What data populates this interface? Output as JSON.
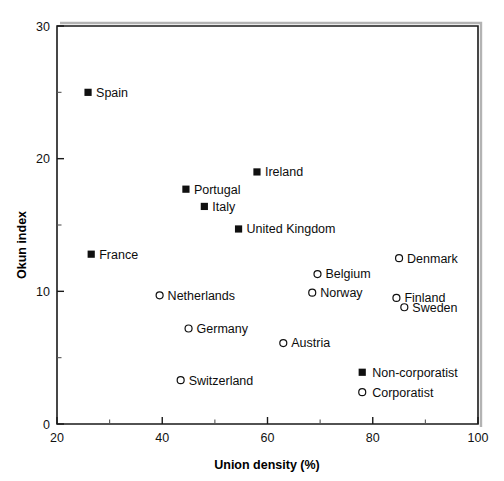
{
  "chart_data": {
    "type": "scatter",
    "title": "",
    "xlabel": "Union density (%)",
    "ylabel": "Okun index",
    "xlim": [
      20,
      100
    ],
    "ylim": [
      0,
      30
    ],
    "grid": false,
    "xticks": [
      20,
      40,
      60,
      80,
      100
    ],
    "xtick_labels": [
      "20",
      "40",
      "60",
      "80",
      "100"
    ],
    "xticks_minor": [
      30,
      50,
      70,
      90
    ],
    "yticks": [
      0,
      10,
      20,
      30
    ],
    "ytick_labels": [
      "0",
      "10",
      "20",
      "30"
    ],
    "yticks_minor": [
      5,
      15,
      25
    ],
    "legend_position": "inside-bottom-right",
    "series": [
      {
        "name": "Non-corporatist",
        "marker": "filled-square",
        "points": [
          {
            "label": "Spain",
            "x": 25.9,
            "y": 25.0,
            "label_side": "right"
          },
          {
            "label": "Ireland",
            "x": 58.0,
            "y": 19.0,
            "label_side": "right"
          },
          {
            "label": "Portugal",
            "x": 44.5,
            "y": 17.7,
            "label_side": "right"
          },
          {
            "label": "Italy",
            "x": 48.0,
            "y": 16.4,
            "label_side": "right"
          },
          {
            "label": "United Kingdom",
            "x": 54.5,
            "y": 14.7,
            "label_side": "right"
          },
          {
            "label": "France",
            "x": 26.5,
            "y": 12.8,
            "label_side": "right"
          }
        ]
      },
      {
        "name": "Corporatist",
        "marker": "open-circle",
        "points": [
          {
            "label": "Denmark",
            "x": 85.0,
            "y": 12.5,
            "label_side": "right"
          },
          {
            "label": "Belgium",
            "x": 69.5,
            "y": 11.3,
            "label_side": "right"
          },
          {
            "label": "Norway",
            "x": 68.5,
            "y": 9.9,
            "label_side": "right"
          },
          {
            "label": "Netherlands",
            "x": 39.5,
            "y": 9.7,
            "label_side": "right"
          },
          {
            "label": "Finland",
            "x": 84.5,
            "y": 9.5,
            "label_side": "right"
          },
          {
            "label": "Sweden",
            "x": 86.0,
            "y": 8.8,
            "label_side": "right"
          },
          {
            "label": "Germany",
            "x": 45.0,
            "y": 7.2,
            "label_side": "right"
          },
          {
            "label": "Austria",
            "x": 63.0,
            "y": 6.1,
            "label_side": "right"
          },
          {
            "label": "Switzerland",
            "x": 43.5,
            "y": 3.3,
            "label_side": "right"
          }
        ]
      }
    ],
    "legend": [
      {
        "label": "Non-corporatist",
        "marker": "filled-square",
        "x": 78.0,
        "y": 3.9
      },
      {
        "label": "Corporatist",
        "marker": "open-circle",
        "x": 78.0,
        "y": 2.4
      }
    ],
    "colors": {
      "marker": "#101010",
      "axis": "#1a1a1a",
      "background": "#ffffff"
    }
  }
}
